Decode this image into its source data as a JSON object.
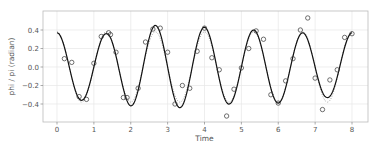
{
  "chart_data": {
    "type": "line",
    "title": "",
    "xlabel": "Time",
    "ylabel": "phi / pi (radian)",
    "xlim": [
      -0.42,
      8.42
    ],
    "ylim": [
      -0.6,
      0.6
    ],
    "xticks": [
      0,
      1,
      2,
      3,
      4,
      5,
      6,
      7,
      8
    ],
    "xtick_labels": [
      "0",
      "1",
      "2",
      "3",
      "4",
      "5",
      "6",
      "7",
      "8"
    ],
    "yticks": [
      0.4,
      0.2,
      0.0,
      -0.2,
      -0.4
    ],
    "ytick_labels": [
      "0.4",
      "0.2",
      "0.0",
      "−0.2",
      "−0.4"
    ],
    "grid": true,
    "legend": null,
    "series": [
      {
        "name": "observations",
        "style": "open-circle-markers",
        "color": "#333333",
        "x": [
          0.2,
          0.4,
          0.6,
          0.8,
          1.0,
          1.2,
          1.4,
          1.45,
          1.6,
          1.8,
          1.9,
          2.2,
          2.4,
          2.6,
          2.8,
          3.0,
          3.2,
          3.4,
          3.6,
          3.8,
          4.0,
          4.2,
          4.4,
          4.6,
          4.8,
          5.0,
          5.2,
          5.4,
          5.6,
          5.8,
          6.0,
          6.2,
          6.4,
          6.6,
          6.8,
          7.0,
          7.2,
          7.4,
          7.6,
          7.8,
          8.0
        ],
        "values": [
          0.09,
          0.05,
          -0.32,
          -0.35,
          0.04,
          0.33,
          0.37,
          0.35,
          0.16,
          -0.33,
          -0.33,
          -0.23,
          0.27,
          0.41,
          0.42,
          0.16,
          -0.4,
          -0.2,
          -0.23,
          0.17,
          0.42,
          0.1,
          -0.03,
          -0.53,
          -0.24,
          -0.01,
          0.2,
          0.39,
          0.3,
          -0.3,
          -0.39,
          -0.15,
          0.09,
          0.4,
          0.53,
          -0.12,
          -0.46,
          -0.14,
          -0.03,
          0.32,
          0.36
        ]
      },
      {
        "name": "estimate",
        "style": "solid-line",
        "color": "#111111",
        "model": "A(t) * cos(2*pi*0.75*t)",
        "amplitude_at_t": {
          "0": 0.37,
          "0.67": 0.36,
          "1.33": 0.36,
          "2.0": 0.42,
          "2.67": 0.45,
          "3.33": 0.44,
          "4.0": 0.43,
          "4.67": 0.4,
          "5.33": 0.4,
          "6.0": 0.39,
          "6.67": 0.37,
          "7.33": 0.33,
          "8.0": 0.37
        }
      },
      {
        "name": "true-signal",
        "style": "dotted-line",
        "color": "#999999",
        "model": "0.38 * cos(2*pi*0.75*t)",
        "amplitude": 0.38,
        "frequency": 0.75
      }
    ]
  }
}
